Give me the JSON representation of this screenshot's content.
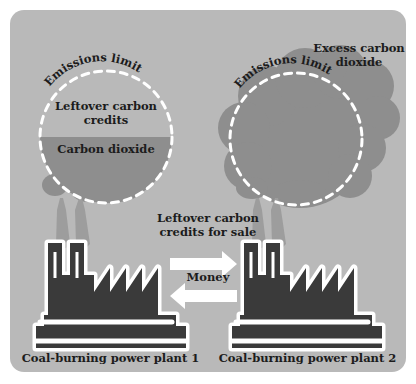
{
  "diagram": {
    "title_context": "Carbon credit trading between two coal-burning power plants",
    "colors": {
      "page_background": "#ffffff",
      "panel_background": "#b9b9b9",
      "cloud_fill": "#8e8e8e",
      "plume_fill": "#9d9d9d",
      "factory_fill": "#3a3a3a",
      "outline_white": "#ffffff",
      "text_dark": "#1c1c1c",
      "dashed_limit": "#ffffff"
    }
  },
  "left_plant": {
    "emissions_limit_label": "Emissions limit",
    "leftover_label_line1": "Leftover carbon",
    "leftover_label_line2": "credits",
    "carbon_dioxide_label": "Carbon dioxide",
    "caption": "Coal-burning power plant 1",
    "fill_fraction_percent": 45
  },
  "right_plant": {
    "emissions_limit_label": "Emissions limit",
    "excess_label_line1": "Excess carbon",
    "excess_label_line2": "dioxide",
    "caption": "Coal-burning power plant 2",
    "fill_fraction_percent": 100
  },
  "exchange": {
    "sale_label_line1": "Leftover carbon",
    "sale_label_line2": "credits for sale",
    "money_label": "Money",
    "arrow_right_direction": "right",
    "arrow_left_direction": "left"
  }
}
